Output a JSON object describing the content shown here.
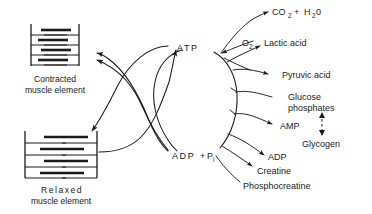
{
  "figure": {
    "background_color": "#ffffff",
    "ink_color": "#1a1a1a"
  },
  "cycle": {
    "top_label": "ATP",
    "bottom_label": "ADP",
    "bottom_label_plus": "+",
    "bottom_label_phosphate": "P",
    "bottom_label_phosphate_sub": "i"
  },
  "muscle": {
    "contracted": {
      "caption_line1": "Contracted",
      "caption_line2": "muscle  element"
    },
    "relaxed": {
      "caption_line1": "Relaxed",
      "caption_line2": "muscle  element"
    }
  },
  "products": {
    "co2": "CO",
    "co2_sub": "2",
    "plus": "+",
    "h2o": "H",
    "h2o_sub": "2",
    "h2o_tail": "0",
    "oxygen": "O",
    "oxygen_sub": "2",
    "lactic_acid": "Lactic acid",
    "pyruvic_acid": "Pyruvic acid",
    "glucose_phosphates_line1": "Glucose",
    "glucose_phosphates_line2": "phosphates",
    "amp": "AMP",
    "glycogen": "Glycogen",
    "adp": "ADP",
    "creatine": "Creatine",
    "phosphocreatine": "Phosphocreatine"
  }
}
